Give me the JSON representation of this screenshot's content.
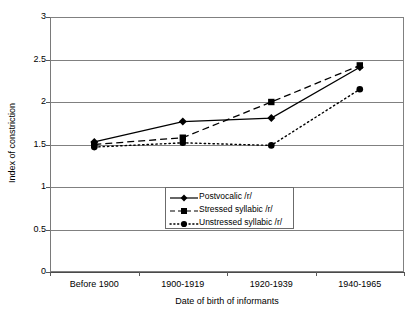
{
  "chart_data": {
    "type": "line",
    "title": "",
    "xlabel": "Date of birth of informants",
    "ylabel": "Index of constriction",
    "categories": [
      "Before 1900",
      "1900-1919",
      "1920-1939",
      "1940-1965"
    ],
    "ylim": [
      0,
      3
    ],
    "yticks": [
      "0",
      "0.5",
      "1",
      "1.5",
      "2",
      "2.5",
      "3"
    ],
    "ytick_values": [
      0,
      0.5,
      1,
      1.5,
      2,
      2.5,
      3
    ],
    "grid": "horizontal",
    "legend_position": "inside-center-lower",
    "series": [
      {
        "name": "Postvocalic /r/",
        "values": [
          1.53,
          1.77,
          1.81,
          2.41
        ],
        "line_style": "solid",
        "marker": "diamond",
        "color": "#000000"
      },
      {
        "name": "Stressed syllabic /r/",
        "values": [
          1.5,
          1.58,
          2.0,
          2.43
        ],
        "line_style": "dashed",
        "marker": "square",
        "color": "#000000"
      },
      {
        "name": "Unstressed syllabic /r/",
        "values": [
          1.47,
          1.52,
          1.49,
          2.15
        ],
        "line_style": "dotted",
        "marker": "circle",
        "color": "#000000"
      }
    ]
  },
  "legend": {
    "items": [
      {
        "label": "Postvocalic /r/"
      },
      {
        "label": "Stressed syllabic /r/"
      },
      {
        "label": "Unstressed syllabic /r/"
      }
    ]
  },
  "axes": {
    "x_title": "Date of birth of informants",
    "y_title": "Index of constriction",
    "x_categories": [
      "Before 1900",
      "1900-1919",
      "1920-1939",
      "1940-1965"
    ],
    "y_labels": [
      "3",
      "2.5",
      "2",
      "1.5",
      "1",
      "0.5",
      "0"
    ]
  }
}
